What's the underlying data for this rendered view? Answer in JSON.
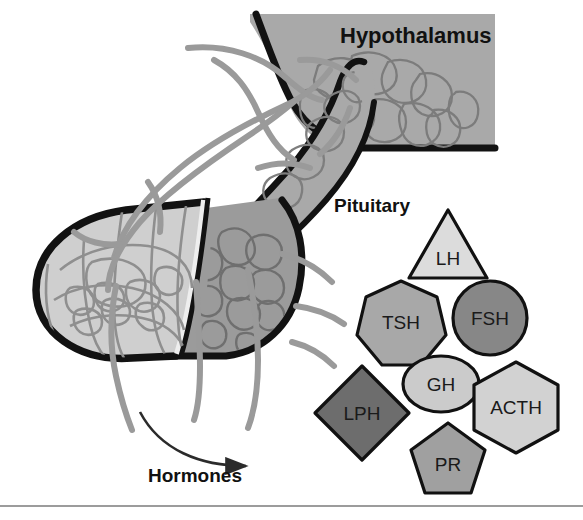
{
  "figure": {
    "width": 583,
    "height": 520,
    "background": "#ffffff"
  },
  "labels": {
    "hypothalamus": "Hypothalamus",
    "pituitary": "Pituitary",
    "hormones": "Hormones"
  },
  "regions": [
    {
      "name": "hypothalamus-block",
      "label": "Hypothalamus",
      "fill": "#a9a9a9",
      "outline": "#111111"
    },
    {
      "name": "infundibulum-stalk",
      "label": "Pituitary stalk",
      "fill": "#a9a9a9",
      "outline": "#111111"
    },
    {
      "name": "anterior-lobe",
      "label": "Anterior lobe",
      "fill": "#cfcfcf",
      "outline": "#111111"
    },
    {
      "name": "posterior-lobe",
      "label": "Posterior lobe",
      "fill": "#9b9b9b",
      "outline": "#111111"
    }
  ],
  "vessels": {
    "name": "portal-vessels",
    "stroke": "#9a9a9a",
    "capillary_stroke": "#8f8f8f"
  },
  "arrow": {
    "name": "hormones-arrow",
    "stroke": "#2b2b2b",
    "direction": "right"
  },
  "divider": {
    "name": "bottom-rule",
    "color": "#9c9c9c"
  },
  "hormones": [
    {
      "id": "lh",
      "label": "LH",
      "shape": "triangle",
      "fill": "#dcdcdc",
      "stroke": "#111111",
      "cx": 448,
      "cy": 248,
      "r": 41
    },
    {
      "id": "tsh",
      "label": "TSH",
      "shape": "heptagon",
      "fill": "#a8a8a8",
      "stroke": "#111111",
      "cx": 401,
      "cy": 322,
      "r": 41
    },
    {
      "id": "fsh",
      "label": "FSH",
      "shape": "circle",
      "fill": "#878787",
      "stroke": "#111111",
      "cx": 490,
      "cy": 318,
      "r": 37
    },
    {
      "id": "gh",
      "label": "GH",
      "shape": "ellipse",
      "fill": "#cbcbcb",
      "stroke": "#111111",
      "cx": 441,
      "cy": 384,
      "r": 38
    },
    {
      "id": "acth",
      "label": "ACTH",
      "shape": "hexagon",
      "fill": "#d2d2d2",
      "stroke": "#111111",
      "cx": 516,
      "cy": 407,
      "r": 45
    },
    {
      "id": "lph",
      "label": "LPH",
      "shape": "diamond",
      "fill": "#6d6d6d",
      "stroke": "#111111",
      "cx": 362,
      "cy": 413,
      "r": 47
    },
    {
      "id": "pr",
      "label": "PR",
      "shape": "pentagon",
      "fill": "#a0a0a0",
      "stroke": "#111111",
      "cx": 448,
      "cy": 460,
      "r": 39
    }
  ]
}
